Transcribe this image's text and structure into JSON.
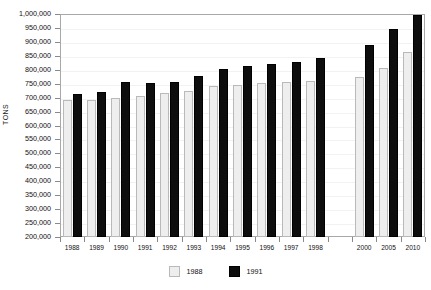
{
  "chart_data": {
    "type": "bar",
    "title": "",
    "subtitle": "",
    "xlabel": "",
    "ylabel": "TONS",
    "ylim": [
      200000,
      1000000
    ],
    "ytick_step": 50000,
    "grid": true,
    "legend_position": "bottom-center",
    "categories": [
      "1988",
      "1989",
      "1990",
      "1991",
      "1992",
      "1993",
      "1994",
      "1995",
      "1996",
      "1997",
      "1998",
      "",
      "2000",
      "2005",
      "2010"
    ],
    "yticks": [
      "1,000,000",
      "950,000",
      "900,000",
      "850,000",
      "800,000",
      "750,000",
      "700,000",
      "650,000",
      "600,000",
      "550,000",
      "500,000",
      "450,000",
      "400,000",
      "350,000",
      "300,000",
      "250,000",
      "200,000"
    ],
    "ytick_values": [
      1000000,
      950000,
      900000,
      850000,
      800000,
      750000,
      700000,
      650000,
      600000,
      550000,
      500000,
      450000,
      400000,
      350000,
      300000,
      250000,
      200000
    ],
    "series": [
      {
        "name": "1988",
        "color": "#eeeeee",
        "values": [
          690000,
          690000,
          697000,
          705000,
          718000,
          725000,
          740000,
          745000,
          752000,
          757000,
          760000,
          null,
          775000,
          808000,
          862000
        ]
      },
      {
        "name": "1991",
        "color": "#0d0d0d",
        "values": [
          712000,
          722000,
          755000,
          753000,
          755000,
          779000,
          801000,
          815000,
          821000,
          829000,
          842000,
          null,
          888000,
          947000,
          995000
        ]
      }
    ]
  },
  "legend": {
    "entries": [
      {
        "label": "1988",
        "style": "light"
      },
      {
        "label": "1991",
        "style": "dark"
      }
    ]
  },
  "colors": {
    "series_light": "#eeeeee",
    "series_light_border": "#b9b9b9",
    "series_dark": "#0d0d0d",
    "frame": "#a8a8a8",
    "gridline": "#f2f2f2",
    "text": "#111111",
    "background": "#ffffff"
  }
}
